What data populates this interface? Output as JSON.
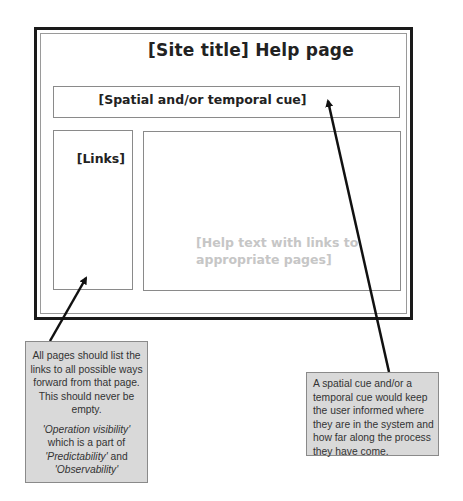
{
  "wireframe": {
    "title": "[Site title]  Help page",
    "cue_bar": "[Spatial and/or temporal cue]",
    "links_panel": "[Links]",
    "content_panel_line1": "[Help text with links to",
    "content_panel_line2": "appropriate pages]"
  },
  "callouts": {
    "links": {
      "paragraph1": "All pages should list the links to all possible ways forward from that page.  This should never be empty.",
      "p2_term1": "'Operation visibility'",
      "p2_mid": " which is a part of ",
      "p2_term2": "'Predictability'",
      "p2_and": " and ",
      "p2_term3": "'Observability'"
    },
    "cue": {
      "text": "A spatial cue and/or a temporal cue would keep the user informed where they are in the system and how far along the process they have come."
    }
  },
  "colors": {
    "frame": "#1a1a1a",
    "panel_border": "#8a8a8a",
    "callout_fill": "#d9d9d9",
    "placeholder_text": "#c6c6c6"
  }
}
